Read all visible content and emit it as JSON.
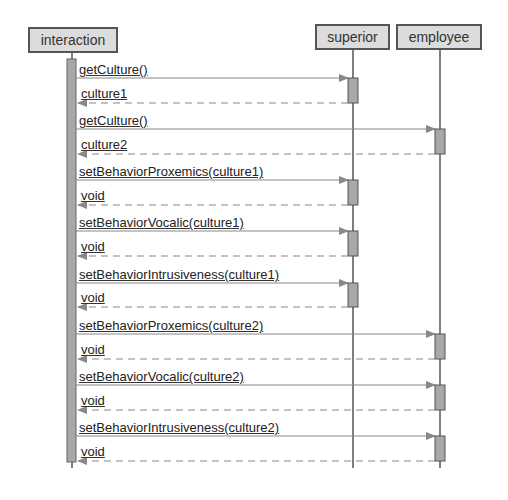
{
  "participants": [
    {
      "name": "interaction",
      "x": 28,
      "y": 27,
      "w": 90,
      "h": 26,
      "lifeline_x": 72
    },
    {
      "name": "superior",
      "x": 315,
      "y": 24,
      "w": 75,
      "h": 26,
      "lifeline_x": 353
    },
    {
      "name": "employee",
      "x": 396,
      "y": 24,
      "w": 86,
      "h": 26,
      "lifeline_x": 440
    }
  ],
  "messages": [
    {
      "call": "getCulture()",
      "ret": "culture1",
      "target": 1,
      "y": 78,
      "ry": 103
    },
    {
      "call": "getCulture()",
      "ret": "culture2",
      "target": 2,
      "y": 129,
      "ry": 154
    },
    {
      "call": "setBehaviorProxemics(culture1)",
      "ret": "void",
      "target": 1,
      "y": 180,
      "ry": 205
    },
    {
      "call": "setBehaviorVocalic(culture1)",
      "ret": "void",
      "target": 1,
      "y": 231,
      "ry": 256
    },
    {
      "call": "setBehaviorIntrusiveness(culture1)",
      "ret": "void",
      "target": 1,
      "y": 283,
      "ry": 307
    },
    {
      "call": "setBehaviorProxemics(culture2)",
      "ret": "void",
      "target": 2,
      "y": 334,
      "ry": 359
    },
    {
      "call": "setBehaviorVocalic(culture2)",
      "ret": "void",
      "target": 2,
      "y": 385,
      "ry": 410
    },
    {
      "call": "setBehaviorIntrusiveness(culture2)",
      "ret": "void",
      "target": 2,
      "y": 436,
      "ry": 461
    }
  ]
}
